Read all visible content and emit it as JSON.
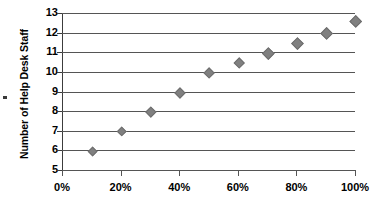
{
  "chart_data": {
    "type": "scatter",
    "title": "",
    "xlabel": "",
    "ylabel": "Number of Help Desk Staff",
    "x": [
      10,
      20,
      30,
      40,
      50,
      60,
      70,
      80,
      90,
      100
    ],
    "values": [
      6,
      7,
      8,
      9,
      10,
      10.5,
      11,
      11.5,
      12,
      12.6
    ],
    "x_tick_labels": [
      "0%",
      "20%",
      "40%",
      "60%",
      "80%",
      "100%"
    ],
    "x_tick_values": [
      0,
      20,
      40,
      60,
      80,
      100
    ],
    "y_tick_labels": [
      "13",
      "12",
      "11",
      "10",
      "9",
      "8",
      "7",
      "6",
      "5"
    ],
    "y_tick_values": [
      13,
      12,
      11,
      10,
      9,
      8,
      7,
      6,
      5
    ],
    "xlim": [
      0,
      100
    ],
    "ylim": [
      5,
      13
    ],
    "grid": "horizontal",
    "legend": "none",
    "marker_shape": "diamond",
    "marker_color": "#808080",
    "gridline_color": "#555555",
    "axis_color": "#3c3c3c",
    "text_color": "#000000"
  }
}
